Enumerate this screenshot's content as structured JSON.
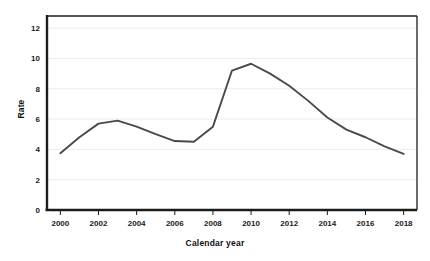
{
  "chart_data": {
    "type": "line",
    "title": "",
    "xlabel": "Calendar year",
    "ylabel": "Rate",
    "x": [
      2000,
      2001,
      2002,
      2003,
      2004,
      2005,
      2006,
      2007,
      2008,
      2009,
      2010,
      2011,
      2012,
      2013,
      2014,
      2015,
      2016,
      2017,
      2018
    ],
    "series": [
      {
        "name": "Rate",
        "color": "#4a4a4a",
        "values": [
          3.75,
          4.8,
          5.7,
          5.9,
          5.5,
          5.0,
          4.55,
          4.5,
          5.5,
          9.2,
          9.65,
          9.0,
          8.2,
          7.2,
          6.1,
          5.3,
          4.8,
          4.2,
          3.7
        ]
      }
    ],
    "xlim": [
      1999.3,
      2018.7
    ],
    "ylim": [
      0,
      12.8
    ],
    "xticks": [
      2000,
      2002,
      2004,
      2006,
      2008,
      2010,
      2012,
      2014,
      2016,
      2018
    ],
    "xtick_labels": [
      "2000",
      "2002",
      "2004",
      "2006",
      "2008",
      "2010",
      "2012",
      "2014",
      "2016",
      "2018"
    ],
    "yticks": [
      0,
      2,
      4,
      6,
      8,
      10,
      12
    ],
    "ytick_labels": [
      "0",
      "2",
      "4",
      "6",
      "8",
      "10",
      "12"
    ],
    "grid": {
      "horizontal": true,
      "vertical": false,
      "color": "#e9e9e9"
    },
    "legend": {
      "visible": false,
      "position": "none",
      "entries": []
    },
    "annotations": [],
    "axis_color": "#1c1c1c",
    "background": "#ffffff"
  }
}
